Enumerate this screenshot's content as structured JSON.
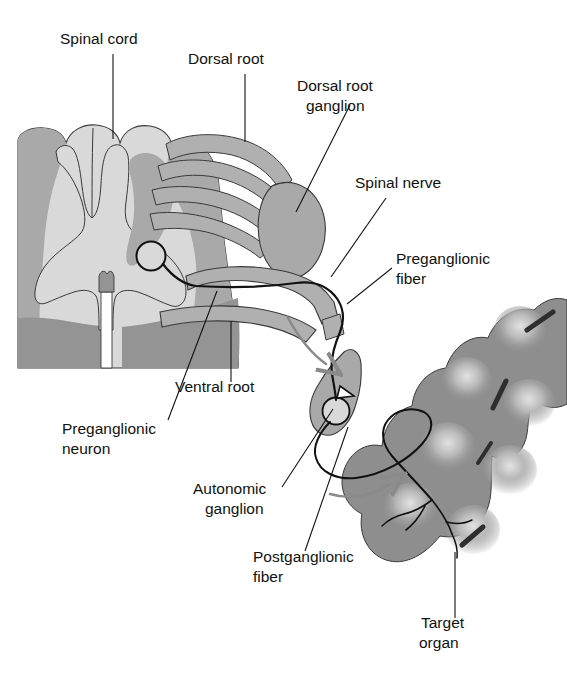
{
  "figure": {
    "background": "#ffffff"
  },
  "palette": {
    "gray_matter": "#a9a9a9",
    "white_matter": "#d9d9d9",
    "ventral_dark": "#949494",
    "nerve_gray": "#b0b0b0",
    "ganglion_gray": "#a9a9a9",
    "organ_gray": "#8e8e8e",
    "organ_highlight": "#d6d6d6",
    "fiber_black": "#111111",
    "arrow_gray": "#8a8a8a",
    "leader_line": "#111111",
    "text": "#111111"
  },
  "labels": [
    {
      "id": "spinal-cord",
      "line1": "Spinal cord",
      "line2": "",
      "x": 60,
      "y": 44,
      "anchor": "start"
    },
    {
      "id": "dorsal-root",
      "line1": "Dorsal root",
      "line2": "",
      "x": 188,
      "y": 64,
      "anchor": "start"
    },
    {
      "id": "dorsal-root-ganglion",
      "line1": "Dorsal root",
      "line2": "ganglion",
      "x": 297,
      "y": 91,
      "anchor": "start"
    },
    {
      "id": "spinal-nerve",
      "line1": "Spinal nerve",
      "line2": "",
      "x": 355,
      "y": 188,
      "anchor": "start"
    },
    {
      "id": "preganglionic-fiber",
      "line1": "Preganglionic",
      "line2": "fiber",
      "x": 396,
      "y": 264,
      "anchor": "start"
    },
    {
      "id": "ventral-root",
      "line1": "Ventral root",
      "line2": "",
      "x": 175,
      "y": 392,
      "anchor": "start"
    },
    {
      "id": "preganglionic-neuron",
      "line1": "Preganglionic",
      "line2": "neuron",
      "x": 62,
      "y": 434,
      "anchor": "start"
    },
    {
      "id": "autonomic-ganglion",
      "line1": "Autonomic",
      "line2": "ganglion",
      "x": 193,
      "y": 494,
      "anchor": "start"
    },
    {
      "id": "postganglionic-fiber",
      "line1": "Postganglionic",
      "line2": "fiber",
      "x": 253,
      "y": 562,
      "anchor": "start"
    },
    {
      "id": "target-organ",
      "line1": "Target",
      "line2": "organ",
      "x": 421,
      "y": 628,
      "anchor": "start"
    }
  ],
  "leader_lines": [
    {
      "id": "leader-spinal-cord",
      "d": "M 113 54 L 113 139"
    },
    {
      "id": "leader-dorsal-root",
      "d": "M 245 74 L 245 142"
    },
    {
      "id": "leader-dorsal-root-ganglion",
      "d": "M 350 105 L 296 212"
    },
    {
      "id": "leader-spinal-nerve",
      "d": "M 386 198 L 331 277"
    },
    {
      "id": "leader-preganglionic-fiber",
      "d": "M 392 268 L 347 304"
    },
    {
      "id": "leader-ventral-root",
      "d": "M 231 382 L 231 321"
    },
    {
      "id": "leader-preganglionic-neuron",
      "d": "M 168 420 L 217 291"
    },
    {
      "id": "leader-autonomic-ganglion",
      "d": "M 282 487 L 333 409"
    },
    {
      "id": "leader-postganglionic-fiber",
      "d": "M 305 551 L 348 427"
    },
    {
      "id": "leader-target-organ",
      "d": "M 455 618 L 455 552"
    }
  ],
  "structures": {
    "spinal_cord_outline": "Transverse section of spinal cord, left portion",
    "gray_matter": "Butterfly-shaped central gray matter",
    "dorsal_rootlets_count": 4,
    "fibers": {
      "preganglionic": "black line from cell body in lateral horn through ventral root and spinal nerve to autonomic ganglion",
      "postganglionic": "black line from autonomic ganglion to target organ branches"
    },
    "arrows": 2
  }
}
